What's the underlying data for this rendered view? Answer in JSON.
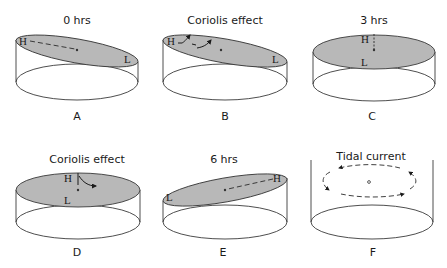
{
  "figure": {
    "panels": [
      {
        "id": "A",
        "title": "0 hrs",
        "label": "A",
        "high": "H",
        "low": "L"
      },
      {
        "id": "B",
        "title": "Coriolis effect",
        "label": "B",
        "high": "H",
        "low": "L"
      },
      {
        "id": "C",
        "title": "3 hrs",
        "label": "C",
        "high": "H",
        "low": "L"
      },
      {
        "id": "D",
        "title": "Coriolis effect",
        "label": "D",
        "high": "H",
        "low": "L"
      },
      {
        "id": "E",
        "title": "6 hrs",
        "label": "E",
        "high": "H",
        "low": "L"
      },
      {
        "id": "F",
        "title": "Tidal current",
        "label": "F"
      }
    ],
    "colors": {
      "water_surface": "#b8b8b8",
      "outline": "#3a3a3a",
      "background": "#ffffff"
    }
  }
}
